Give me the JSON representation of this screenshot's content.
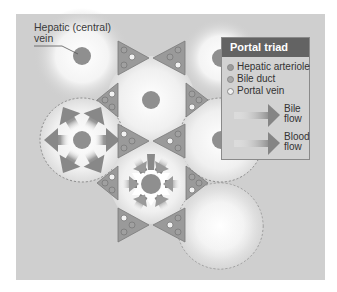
{
  "figure": {
    "callout_label": "Hepatic (central)\nvein",
    "callout_line1": "Hepatic (central)",
    "callout_line2": "vein"
  },
  "legend": {
    "title": "Portal triad",
    "items": [
      {
        "label": "Hepatic arteriole",
        "color": "#9a9a9a"
      },
      {
        "label": "Bile duct",
        "color": "#a8a8a8"
      },
      {
        "label": "Portal vein",
        "color": "#f2f2f2"
      }
    ],
    "flows": [
      {
        "label_line1": "Bile",
        "label_line2": "flow"
      },
      {
        "label_line1": "Blood",
        "label_line2": "flow"
      }
    ]
  },
  "colors": {
    "panel_background": "#cfcfcf",
    "triad_fill": "#9a9a9a",
    "central_vein": "#8f8f8f",
    "legend_header": "#636363",
    "arrow": "#8a8a8a"
  }
}
